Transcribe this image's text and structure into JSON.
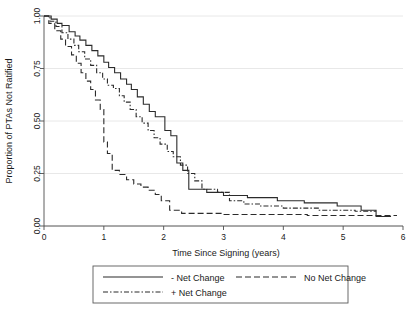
{
  "chart_data": {
    "type": "line",
    "title": "",
    "subtitle": "",
    "xlabel": "Time Since Signing (years)",
    "ylabel": "Proportion of PTAs Not Ratified",
    "xlim": [
      0,
      6
    ],
    "ylim": [
      0,
      1
    ],
    "xticks": [
      0,
      1,
      2,
      3,
      4,
      5,
      6
    ],
    "xtick_labels": [
      "0",
      "1",
      "2",
      "3",
      "4",
      "5",
      "6"
    ],
    "yticks": [
      0.0,
      0.25,
      0.5,
      0.75,
      1.0
    ],
    "ytick_labels": [
      "0.00",
      "0.25",
      "0.50",
      "0.75",
      "1.00"
    ],
    "grid": true,
    "grid_axis": "y",
    "grid_color": "#e8e8e8",
    "legend_position": "bottom",
    "curve_style": "step",
    "line_color": "#2b2b2b",
    "series": [
      {
        "name": "- Net Change",
        "dash": "solid",
        "points": [
          [
            0.0,
            1.0
          ],
          [
            0.12,
            1.0
          ],
          [
            0.12,
            0.985
          ],
          [
            0.22,
            0.985
          ],
          [
            0.22,
            0.965
          ],
          [
            0.3,
            0.965
          ],
          [
            0.3,
            0.955
          ],
          [
            0.42,
            0.955
          ],
          [
            0.42,
            0.925
          ],
          [
            0.52,
            0.925
          ],
          [
            0.52,
            0.905
          ],
          [
            0.6,
            0.905
          ],
          [
            0.6,
            0.885
          ],
          [
            0.7,
            0.885
          ],
          [
            0.7,
            0.86
          ],
          [
            0.8,
            0.86
          ],
          [
            0.8,
            0.835
          ],
          [
            0.9,
            0.835
          ],
          [
            0.9,
            0.81
          ],
          [
            1.0,
            0.81
          ],
          [
            1.0,
            0.78
          ],
          [
            1.08,
            0.78
          ],
          [
            1.08,
            0.755
          ],
          [
            1.18,
            0.755
          ],
          [
            1.18,
            0.73
          ],
          [
            1.28,
            0.73
          ],
          [
            1.28,
            0.7
          ],
          [
            1.38,
            0.7
          ],
          [
            1.38,
            0.675
          ],
          [
            1.46,
            0.675
          ],
          [
            1.46,
            0.65
          ],
          [
            1.56,
            0.65
          ],
          [
            1.56,
            0.615
          ],
          [
            1.66,
            0.615
          ],
          [
            1.66,
            0.58
          ],
          [
            1.76,
            0.58
          ],
          [
            1.76,
            0.545
          ],
          [
            1.86,
            0.545
          ],
          [
            1.86,
            0.52
          ],
          [
            2.02,
            0.52
          ],
          [
            2.02,
            0.455
          ],
          [
            2.12,
            0.455
          ],
          [
            2.12,
            0.43
          ],
          [
            2.22,
            0.43
          ],
          [
            2.22,
            0.3
          ],
          [
            2.32,
            0.3
          ],
          [
            2.32,
            0.265
          ],
          [
            2.42,
            0.265
          ],
          [
            2.42,
            0.175
          ],
          [
            2.72,
            0.175
          ],
          [
            2.72,
            0.16
          ],
          [
            3.0,
            0.16
          ],
          [
            3.0,
            0.145
          ],
          [
            3.4,
            0.145
          ],
          [
            3.4,
            0.135
          ],
          [
            3.9,
            0.135
          ],
          [
            3.9,
            0.12
          ],
          [
            4.35,
            0.12
          ],
          [
            4.35,
            0.11
          ],
          [
            4.9,
            0.11
          ],
          [
            4.9,
            0.095
          ],
          [
            5.3,
            0.095
          ],
          [
            5.3,
            0.075
          ],
          [
            5.55,
            0.075
          ],
          [
            5.55,
            0.045
          ],
          [
            5.8,
            0.045
          ]
        ]
      },
      {
        "name": "No Net Change",
        "dash": "dashed",
        "points": [
          [
            0.0,
            1.0
          ],
          [
            0.08,
            1.0
          ],
          [
            0.08,
            0.965
          ],
          [
            0.18,
            0.965
          ],
          [
            0.18,
            0.93
          ],
          [
            0.28,
            0.93
          ],
          [
            0.28,
            0.89
          ],
          [
            0.36,
            0.89
          ],
          [
            0.36,
            0.855
          ],
          [
            0.46,
            0.855
          ],
          [
            0.46,
            0.815
          ],
          [
            0.54,
            0.815
          ],
          [
            0.54,
            0.775
          ],
          [
            0.62,
            0.775
          ],
          [
            0.62,
            0.73
          ],
          [
            0.7,
            0.73
          ],
          [
            0.7,
            0.69
          ],
          [
            0.78,
            0.69
          ],
          [
            0.78,
            0.65
          ],
          [
            0.86,
            0.65
          ],
          [
            0.86,
            0.6
          ],
          [
            0.94,
            0.6
          ],
          [
            0.94,
            0.555
          ],
          [
            1.0,
            0.555
          ],
          [
            1.0,
            0.4
          ],
          [
            1.06,
            0.4
          ],
          [
            1.06,
            0.345
          ],
          [
            1.14,
            0.345
          ],
          [
            1.14,
            0.265
          ],
          [
            1.26,
            0.265
          ],
          [
            1.26,
            0.245
          ],
          [
            1.38,
            0.245
          ],
          [
            1.38,
            0.22
          ],
          [
            1.5,
            0.22
          ],
          [
            1.5,
            0.2
          ],
          [
            1.62,
            0.2
          ],
          [
            1.62,
            0.185
          ],
          [
            1.74,
            0.185
          ],
          [
            1.74,
            0.17
          ],
          [
            1.86,
            0.17
          ],
          [
            1.86,
            0.15
          ],
          [
            1.96,
            0.15
          ],
          [
            1.96,
            0.12
          ],
          [
            2.1,
            0.12
          ],
          [
            2.1,
            0.075
          ],
          [
            2.3,
            0.075
          ],
          [
            2.3,
            0.06
          ],
          [
            3.0,
            0.06
          ],
          [
            3.0,
            0.055
          ],
          [
            4.4,
            0.055
          ],
          [
            4.4,
            0.05
          ],
          [
            5.9,
            0.05
          ]
        ]
      },
      {
        "name": "+ Net Change",
        "dash": "dashdot",
        "points": [
          [
            0.0,
            1.0
          ],
          [
            0.1,
            1.0
          ],
          [
            0.1,
            0.975
          ],
          [
            0.2,
            0.975
          ],
          [
            0.2,
            0.95
          ],
          [
            0.3,
            0.95
          ],
          [
            0.3,
            0.92
          ],
          [
            0.4,
            0.92
          ],
          [
            0.4,
            0.89
          ],
          [
            0.5,
            0.89
          ],
          [
            0.5,
            0.86
          ],
          [
            0.58,
            0.86
          ],
          [
            0.58,
            0.83
          ],
          [
            0.68,
            0.83
          ],
          [
            0.68,
            0.795
          ],
          [
            0.78,
            0.795
          ],
          [
            0.78,
            0.765
          ],
          [
            0.88,
            0.765
          ],
          [
            0.88,
            0.73
          ],
          [
            0.98,
            0.73
          ],
          [
            0.98,
            0.7
          ],
          [
            1.06,
            0.7
          ],
          [
            1.06,
            0.67
          ],
          [
            1.16,
            0.67
          ],
          [
            1.16,
            0.655
          ],
          [
            1.26,
            0.655
          ],
          [
            1.26,
            0.62
          ],
          [
            1.34,
            0.62
          ],
          [
            1.34,
            0.59
          ],
          [
            1.44,
            0.59
          ],
          [
            1.44,
            0.555
          ],
          [
            1.54,
            0.555
          ],
          [
            1.54,
            0.52
          ],
          [
            1.64,
            0.52
          ],
          [
            1.64,
            0.49
          ],
          [
            1.74,
            0.49
          ],
          [
            1.74,
            0.455
          ],
          [
            1.84,
            0.455
          ],
          [
            1.84,
            0.42
          ],
          [
            1.94,
            0.42
          ],
          [
            1.94,
            0.39
          ],
          [
            2.06,
            0.39
          ],
          [
            2.06,
            0.355
          ],
          [
            2.16,
            0.355
          ],
          [
            2.16,
            0.33
          ],
          [
            2.28,
            0.33
          ],
          [
            2.28,
            0.29
          ],
          [
            2.4,
            0.29
          ],
          [
            2.4,
            0.25
          ],
          [
            2.52,
            0.25
          ],
          [
            2.52,
            0.215
          ],
          [
            2.64,
            0.215
          ],
          [
            2.64,
            0.175
          ],
          [
            2.9,
            0.175
          ],
          [
            2.9,
            0.16
          ],
          [
            3.1,
            0.16
          ],
          [
            3.1,
            0.12
          ],
          [
            3.34,
            0.12
          ],
          [
            3.34,
            0.105
          ],
          [
            3.6,
            0.105
          ],
          [
            3.6,
            0.095
          ],
          [
            4.0,
            0.095
          ],
          [
            4.0,
            0.085
          ],
          [
            4.6,
            0.085
          ],
          [
            4.6,
            0.075
          ],
          [
            5.2,
            0.075
          ],
          [
            5.2,
            0.07
          ],
          [
            5.55,
            0.07
          ]
        ]
      }
    ]
  },
  "legend": {
    "items": [
      {
        "label": "- Net Change",
        "dash": "solid"
      },
      {
        "label": "No Net Change",
        "dash": "dashed"
      },
      {
        "label": "+ Net Change",
        "dash": "dashdot"
      }
    ]
  }
}
